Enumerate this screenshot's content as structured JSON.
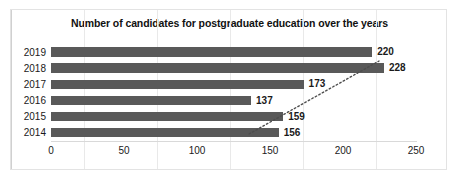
{
  "chart_data": {
    "type": "bar",
    "orientation": "horizontal",
    "title": "Number of candidates for postgraduate education over the years",
    "categories": [
      "2019",
      "2018",
      "2017",
      "2016",
      "2015",
      "2014"
    ],
    "values": [
      220,
      228,
      173,
      137,
      159,
      156
    ],
    "data_labels": [
      "220",
      "228",
      "173",
      "137",
      "159",
      "156"
    ],
    "xlabel": "",
    "ylabel": "",
    "xlim": [
      0,
      250
    ],
    "xticks": [
      0,
      50,
      100,
      150,
      200,
      250
    ],
    "xtick_labels": [
      "0",
      "50",
      "100",
      "150",
      "200",
      "250"
    ],
    "grid": true,
    "legend": false,
    "series": [
      {
        "name": "Number of candidates",
        "values": [
          220,
          228,
          173,
          137,
          159,
          156
        ],
        "color": "#595959"
      }
    ],
    "annotations": [
      {
        "type": "trendline",
        "style": "dotted",
        "color": "#4d4d4d",
        "description": "dotted linear trendline rising left-to-right across the bars"
      }
    ]
  },
  "colors": {
    "bar": "#595959",
    "trendline": "#4d4d4d",
    "gridline": "#e9e9e9",
    "axis": "#d9d9d9",
    "text": "#1a1a1a",
    "border": "#e3e3e3",
    "background": "#ffffff"
  }
}
